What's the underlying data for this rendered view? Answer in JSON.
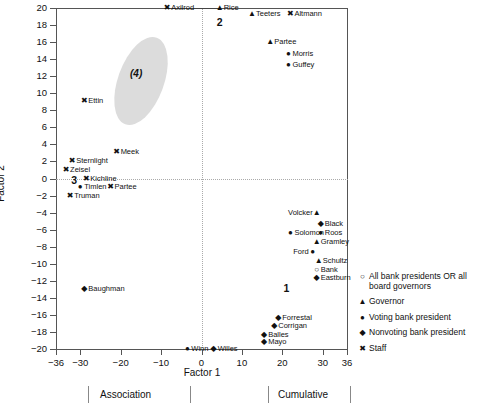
{
  "chart_data": {
    "type": "scatter",
    "title": "",
    "xlabel": "Factor 1",
    "ylabel": "Factor 2",
    "xlim": [
      -36,
      36
    ],
    "ylim": [
      -20,
      20
    ],
    "xticks": [
      -36,
      -30,
      -20,
      -10,
      0,
      10,
      20,
      30,
      36
    ],
    "yticks": [
      -20,
      -18,
      -16,
      -14,
      -12,
      -10,
      -8,
      -6,
      -4,
      -2,
      0,
      2,
      4,
      6,
      8,
      10,
      12,
      14,
      16,
      18,
      20
    ],
    "grid": false,
    "zero_lines": "dotted at x=0 and y=0",
    "legend_position": "right",
    "points": [
      {
        "label": "Axilrod",
        "x": -8.5,
        "y": 20,
        "marker": "staff",
        "side": "right"
      },
      {
        "label": "Rice",
        "x": 4.5,
        "y": 20,
        "marker": "governor",
        "side": "right"
      },
      {
        "label": "Teeters",
        "x": 12.5,
        "y": 19.3,
        "marker": "governor",
        "side": "right"
      },
      {
        "label": "Altmann",
        "x": 22,
        "y": 19.3,
        "marker": "staff",
        "side": "right"
      },
      {
        "label": "Partee",
        "x": 17,
        "y": 16,
        "marker": "governor",
        "side": "right"
      },
      {
        "label": "Morris",
        "x": 21.5,
        "y": 14.6,
        "marker": "voting",
        "side": "right"
      },
      {
        "label": "Guffey",
        "x": 21.5,
        "y": 13.3,
        "marker": "voting",
        "side": "right"
      },
      {
        "label": "Ettin",
        "x": -29,
        "y": 9.1,
        "marker": "staff",
        "side": "right"
      },
      {
        "label": "Meek",
        "x": -21,
        "y": 3.1,
        "marker": "staff",
        "side": "right"
      },
      {
        "label": "Sternlight",
        "x": -32,
        "y": 2,
        "marker": "staff",
        "side": "right"
      },
      {
        "label": "Zeisel",
        "x": -33.5,
        "y": 1,
        "marker": "staff",
        "side": "right"
      },
      {
        "label": "Kichline",
        "x": -28.5,
        "y": 0,
        "marker": "staff",
        "side": "right"
      },
      {
        "label": "Timlen",
        "x": -30,
        "y": -1,
        "marker": "voting",
        "side": "right"
      },
      {
        "label": "Partee2",
        "x": -22.5,
        "y": -1,
        "marker": "staff",
        "side": "right",
        "text": "Partee"
      },
      {
        "label": "Truman",
        "x": -32.5,
        "y": -2,
        "marker": "staff",
        "side": "right"
      },
      {
        "label": "Volcker",
        "x": 28.5,
        "y": -4.1,
        "marker": "governor",
        "side": "left"
      },
      {
        "label": "Black",
        "x": 29.5,
        "y": -5.3,
        "marker": "nonvoting",
        "side": "right"
      },
      {
        "label": "Roos",
        "x": 29.5,
        "y": -6.4,
        "marker": "voting",
        "side": "right"
      },
      {
        "label": "Solomon",
        "x": 22,
        "y": -6.4,
        "marker": "voting",
        "side": "right"
      },
      {
        "label": "Gramley",
        "x": 28.5,
        "y": -7.5,
        "marker": "governor",
        "side": "right"
      },
      {
        "label": "Ford",
        "x": 27.5,
        "y": -8.6,
        "marker": "voting",
        "side": "left"
      },
      {
        "label": "Schultz",
        "x": 29,
        "y": -9.7,
        "marker": "governor",
        "side": "right"
      },
      {
        "label": "Bank",
        "x": 28.5,
        "y": -10.7,
        "marker": "allpres",
        "side": "right"
      },
      {
        "label": "Eastburn",
        "x": 28.5,
        "y": -11.7,
        "marker": "nonvoting",
        "side": "right"
      },
      {
        "label": "Baughman",
        "x": -29,
        "y": -13,
        "marker": "nonvoting",
        "side": "right"
      },
      {
        "label": "Forrestal",
        "x": 19,
        "y": -16.4,
        "marker": "nonvoting",
        "side": "right"
      },
      {
        "label": "Corrigan",
        "x": 18,
        "y": -17.3,
        "marker": "nonvoting",
        "side": "right"
      },
      {
        "label": "Balles",
        "x": 15.5,
        "y": -18.3,
        "marker": "nonvoting",
        "side": "right"
      },
      {
        "label": "Mayo",
        "x": 15.5,
        "y": -19.2,
        "marker": "nonvoting",
        "side": "right"
      },
      {
        "label": "Winn",
        "x": -3.5,
        "y": -20,
        "marker": "voting",
        "side": "right"
      },
      {
        "label": "Willes",
        "x": 3,
        "y": -20,
        "marker": "nonvoting",
        "side": "right"
      }
    ],
    "annotations": [
      {
        "text": "(4)",
        "x": -24.5,
        "y": 13,
        "style": "bold-italic-ellipse-label"
      },
      {
        "text": "2",
        "x": 4.5,
        "y": 18.3,
        "style": "bold-number"
      },
      {
        "text": "3",
        "x": -31.5,
        "y": -0.2,
        "style": "bold-number"
      },
      {
        "text": "1",
        "x": 21,
        "y": -12.8,
        "style": "bold-number"
      }
    ],
    "connector": {
      "from_x": -8.5,
      "to_x": 4.5,
      "y": 20
    }
  },
  "legend": {
    "items": [
      {
        "marker": "allpres",
        "label": "All bank presidents OR all board governors"
      },
      {
        "marker": "governor",
        "label": "Governor"
      },
      {
        "marker": "voting",
        "label": "Voting bank president"
      },
      {
        "marker": "nonvoting",
        "label": "Nonvoting bank president"
      },
      {
        "marker": "staff",
        "label": "Staff"
      }
    ]
  },
  "markers": {
    "allpres": "○",
    "governor": "▲",
    "voting": "●",
    "nonvoting": "◆",
    "staff": "✖"
  },
  "bottom_strip": {
    "items": [
      "Association",
      "Cumulative"
    ]
  }
}
